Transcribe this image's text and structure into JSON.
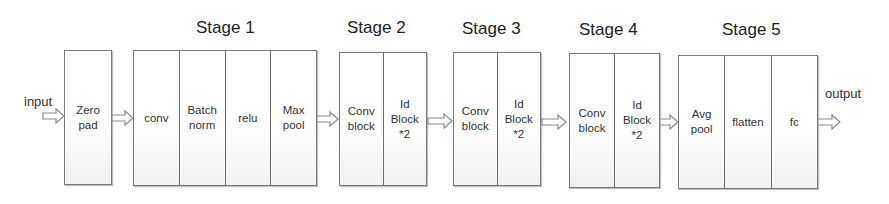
{
  "diagram": {
    "input_label": "input",
    "output_label": "output",
    "blocks": [
      {
        "id": "zero",
        "title": "",
        "cells": [
          "Zero\npad"
        ]
      },
      {
        "id": "stage1",
        "title": "Stage 1",
        "cells": [
          "conv",
          "Batch\nnorm",
          "relu",
          "Max\npool"
        ]
      },
      {
        "id": "stage2",
        "title": "Stage 2",
        "cells": [
          "Conv\nblock",
          "Id\nBlock\n*2"
        ]
      },
      {
        "id": "stage3",
        "title": "Stage 3",
        "cells": [
          "Conv\nblock",
          "Id\nBlock\n*2"
        ]
      },
      {
        "id": "stage4",
        "title": "Stage 4",
        "cells": [
          "Conv\nblock",
          "Id\nBlock\n*2"
        ]
      },
      {
        "id": "stage5",
        "title": "Stage 5",
        "cells": [
          "Avg\npool",
          "flatten",
          "fc"
        ]
      }
    ],
    "colors": {
      "border": "#7a7a7a",
      "text": "#333333",
      "background": "#ffffff"
    }
  }
}
